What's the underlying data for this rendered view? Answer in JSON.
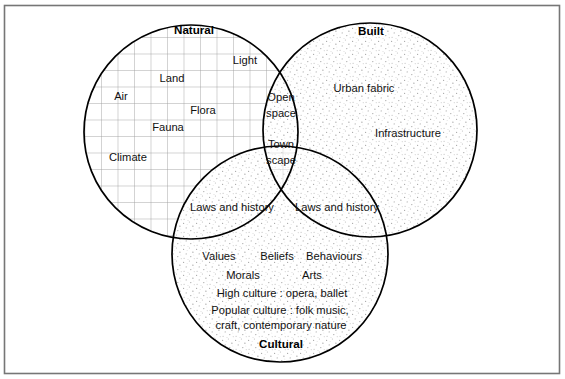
{
  "figure": {
    "type": "venn-diagram",
    "sets": 3,
    "frame_color": "#6f6f6f",
    "outline_color": "#000000",
    "text_color": "#111111"
  },
  "circles": {
    "natural": {
      "title": "Natural",
      "cx": 191,
      "cy": 132,
      "r": 107,
      "fill_pattern": "grid",
      "pattern_color": "#9a9a9a",
      "items": [
        {
          "label": "Air",
          "x": 121,
          "y": 100
        },
        {
          "label": "Land",
          "x": 172,
          "y": 82
        },
        {
          "label": "Light",
          "x": 245,
          "y": 64
        },
        {
          "label": "Flora",
          "x": 203,
          "y": 114
        },
        {
          "label": "Fauna",
          "x": 168,
          "y": 131
        },
        {
          "label": "Climate",
          "x": 128,
          "y": 161
        }
      ]
    },
    "built": {
      "title": "Built",
      "cx": 370,
      "cy": 130,
      "r": 107,
      "fill_pattern": "stipple",
      "pattern_color": "#a8a8a8",
      "items": [
        {
          "label": "Urban fabric",
          "x": 364,
          "y": 92
        },
        {
          "label": "Infrastructure",
          "x": 408,
          "y": 137
        }
      ]
    },
    "cultural": {
      "title": "Cultural",
      "cx": 280,
      "cy": 254,
      "r": 108,
      "fill_pattern": "stipple",
      "pattern_color": "#a8a8a8",
      "items": [
        {
          "label": "Values",
          "x": 219,
          "y": 260
        },
        {
          "label": "Beliefs",
          "x": 277,
          "y": 260
        },
        {
          "label": "Behaviours",
          "x": 334,
          "y": 260
        },
        {
          "label": "Morals",
          "x": 243,
          "y": 279
        },
        {
          "label": "Arts",
          "x": 312,
          "y": 279
        },
        {
          "label": "High culture : opera, ballet",
          "x": 282,
          "y": 297
        },
        {
          "label": "Popular culture : folk music,",
          "x": 280,
          "y": 314
        },
        {
          "label": "craft, contemporary nature",
          "x": 281,
          "y": 329
        }
      ]
    }
  },
  "intersections": {
    "natural_built": {
      "label_line1": "Open",
      "label_line2": "space",
      "x": 281,
      "y1": 101,
      "y2": 117
    },
    "all_three": {
      "label_line1": "Town",
      "label_line2": "scape",
      "x": 281,
      "y1": 148,
      "y2": 164
    },
    "natural_cultural": {
      "label": "Laws and history",
      "x": 232,
      "y": 211
    },
    "built_cultural": {
      "label": "Laws and history",
      "x": 337,
      "y": 211
    }
  },
  "titles": {
    "natural": {
      "label": "Natural",
      "x": 194,
      "y": 34
    },
    "built": {
      "label": "Built",
      "x": 371,
      "y": 35
    },
    "cultural": {
      "label": "Cultural",
      "x": 281,
      "y": 348
    }
  }
}
